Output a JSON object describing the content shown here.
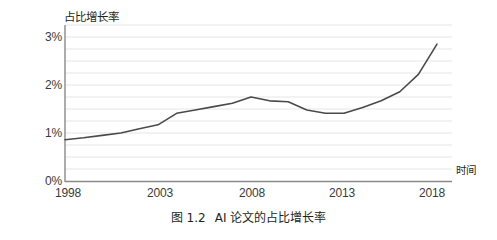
{
  "chart_data": {
    "type": "line",
    "title": "",
    "caption": "图 1.2",
    "caption_text": "AI 论文的占比增长率",
    "xlabel": "时间",
    "ylabel": "占比增长率",
    "grid": true,
    "legend": "none",
    "xlim": [
      1998,
      2018
    ],
    "ylim": [
      0,
      3.25
    ],
    "y_tick_labels": [
      "3%",
      "2%",
      "1%",
      "0%"
    ],
    "y_tick_values": [
      3,
      2,
      1,
      0
    ],
    "x_tick_labels": [
      "1998",
      "2003",
      "2008",
      "2013",
      "2018"
    ],
    "x_tick_values": [
      1998,
      2003,
      2008,
      2013,
      2018
    ],
    "y_unit": "%",
    "gridline_step": 0.25,
    "line_color": "#4a4a4a",
    "grid_color": "#e3e3e3",
    "axis_color": "#8a8a8a",
    "x": [
      1998,
      1999,
      2000,
      2001,
      2002,
      2003,
      2004,
      2005,
      2006,
      2007,
      2008,
      2009,
      2010,
      2011,
      2012,
      2013,
      2014,
      2015,
      2016,
      2017,
      2018
    ],
    "series": [
      {
        "name": "AI 论文的占比增长率",
        "values": [
          0.86,
          0.9,
          0.95,
          1.0,
          1.09,
          1.17,
          1.41,
          1.48,
          1.55,
          1.62,
          1.75,
          1.67,
          1.65,
          1.48,
          1.41,
          1.41,
          1.53,
          1.67,
          1.86,
          2.22,
          2.85
        ]
      }
    ]
  },
  "axes": {
    "y_title": "占比增长率",
    "x_title": "时间"
  }
}
